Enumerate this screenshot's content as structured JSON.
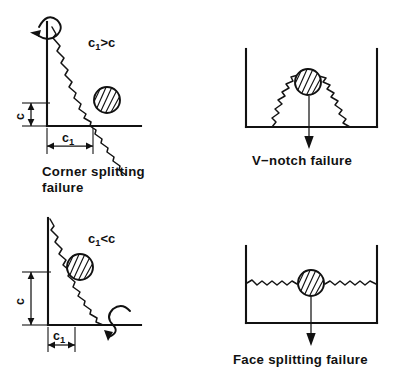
{
  "figure": {
    "background_color": "#ffffff",
    "ink_color": "#111111",
    "panel_count": 4
  },
  "panels": [
    {
      "id": "corner-splitting",
      "position": "top-left",
      "caption_line1": "Corner  splitting",
      "caption_line2": "failure",
      "condition_label": {
        "base": "c",
        "subscript": "1",
        "operator": ">",
        "compare": "c",
        "full": "c1>c"
      },
      "dimensions": [
        {
          "name": "c",
          "orientation": "vertical",
          "label": "c",
          "relative_size": "small"
        },
        {
          "name": "c1",
          "orientation": "horizontal",
          "label": "c",
          "subscript": "1",
          "relative_size": "large"
        }
      ],
      "moment_arrow": {
        "location": "top-of-vertical-edge",
        "direction": "left",
        "type": "curved-moment"
      },
      "crack": {
        "type": "wavy-diagonal",
        "from": "top-left",
        "to": "bottom-right"
      },
      "anchor": {
        "type": "hatched-circle",
        "position": "on-crack-midlower"
      }
    },
    {
      "id": "v-notch",
      "position": "top-right",
      "caption_line1": "V−notch  failure",
      "caption_line2": "",
      "condition_label": null,
      "dimensions": [],
      "load_arrow": {
        "direction": "down",
        "type": "straight"
      },
      "crack": {
        "type": "wavy-inverted-v",
        "apex": "at-anchor"
      },
      "anchor": {
        "type": "hatched-circle",
        "position": "apex-of-notch"
      },
      "container": {
        "walls": [
          "left",
          "bottom",
          "right"
        ],
        "shape": "u-channel"
      }
    },
    {
      "id": "corner-splitting-small-c1",
      "position": "bottom-left",
      "caption_line1": "",
      "caption_line2": "",
      "condition_label": {
        "base": "c",
        "subscript": "1",
        "operator": "<",
        "compare": "c",
        "full": "c1<c"
      },
      "dimensions": [
        {
          "name": "c",
          "orientation": "vertical",
          "label": "c",
          "relative_size": "large"
        },
        {
          "name": "c1",
          "orientation": "horizontal",
          "label": "c",
          "subscript": "1",
          "relative_size": "small"
        }
      ],
      "moment_arrow": {
        "location": "bottom-right-on-baseline",
        "direction": "down",
        "type": "curved-moment"
      },
      "crack": {
        "type": "wavy-diagonal",
        "from": "top-left",
        "to": "bottom-right"
      },
      "anchor": {
        "type": "hatched-circle",
        "position": "on-crack-upper"
      }
    },
    {
      "id": "face-splitting",
      "position": "bottom-right",
      "caption_line1": "Face  splitting  failure",
      "caption_line2": "",
      "condition_label": null,
      "dimensions": [],
      "load_arrow": {
        "direction": "down",
        "type": "straight"
      },
      "crack": {
        "type": "wavy-horizontal",
        "span": "full-width"
      },
      "anchor": {
        "type": "hatched-circle",
        "position": "center-on-crack"
      },
      "container": {
        "walls": [
          "left",
          "bottom",
          "right"
        ],
        "shape": "u-channel"
      }
    }
  ],
  "captions": {
    "corner_splitting_l1": "Corner  splitting",
    "corner_splitting_l2": "failure",
    "v_notch": "V−notch  failure",
    "face_splitting": "Face  splitting  failure"
  },
  "labels": {
    "c_gt": {
      "var": "c",
      "sub": "1",
      "rest": ">c"
    },
    "c_lt": {
      "var": "c",
      "sub": "1",
      "rest": "<c"
    },
    "dim_c": "c",
    "dim_c1_var": "c",
    "dim_c1_sub": "1"
  }
}
